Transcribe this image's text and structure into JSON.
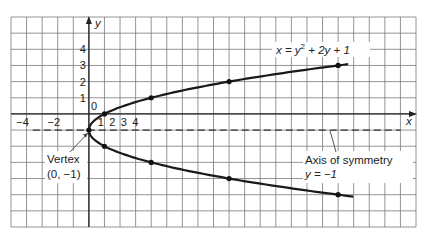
{
  "chart_data": {
    "type": "line",
    "title": "",
    "xlabel": "x",
    "ylabel": "y",
    "xlim": [
      -5,
      21
    ],
    "ylim": [
      -7,
      6
    ],
    "grid": true,
    "x_tick_labels": [
      {
        "value": -4,
        "label": "−4"
      },
      {
        "value": -2,
        "label": "−2"
      },
      {
        "value": 1,
        "label": "1"
      },
      {
        "value": 2,
        "label": "2"
      },
      {
        "value": 3,
        "label": "3"
      },
      {
        "value": 4,
        "label": "4"
      }
    ],
    "y_tick_labels": [
      {
        "value": 4,
        "label": "4"
      },
      {
        "value": 3,
        "label": "3"
      },
      {
        "value": 2,
        "label": "2"
      },
      {
        "value": 1,
        "label": "1"
      },
      {
        "value": 0,
        "label": "0"
      },
      {
        "value": -3,
        "label": "−3"
      },
      {
        "value": -4,
        "label": "−4"
      }
    ],
    "series": [
      {
        "name": "x = y² + 2y + 1",
        "equation": "x = y^2 + 2y + 1",
        "y_range": [
          -5.12,
          3.12
        ],
        "points": [
          {
            "x": 0,
            "y": -1
          },
          {
            "x": 1,
            "y": 0
          },
          {
            "x": 1,
            "y": -2
          },
          {
            "x": 4,
            "y": 1
          },
          {
            "x": 4,
            "y": -3
          },
          {
            "x": 9,
            "y": 2
          },
          {
            "x": 9,
            "y": -4
          },
          {
            "x": 16,
            "y": 3
          },
          {
            "x": 16,
            "y": -5
          }
        ]
      }
    ],
    "axis_of_symmetry": {
      "y": -1,
      "x_from": -3.6,
      "x_to": 20
    },
    "annotations": {
      "equation": {
        "prefix": "x = y",
        "sup": "2",
        "suffix": " + 2y + 1"
      },
      "vertex_line1": "Vertex",
      "vertex_line2": "(0, −1)",
      "axis_line1": "Axis of symmetry",
      "axis_line2": "y = −1",
      "x_axis_label": "x",
      "y_axis_label": "y"
    }
  }
}
